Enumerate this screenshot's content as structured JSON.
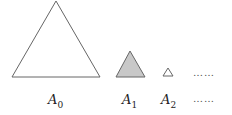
{
  "diagram": {
    "shapes": [
      {
        "id": "A0",
        "label": "A",
        "sub": "0",
        "fill": "#ffffff",
        "stroke": "#666666"
      },
      {
        "id": "A1",
        "label": "A",
        "sub": "1",
        "fill": "#c8c8c8",
        "stroke": "#666666"
      },
      {
        "id": "A2",
        "label": "A",
        "sub": "2",
        "fill": "#ffffff",
        "stroke": "#666666"
      }
    ],
    "continuation_top": "……",
    "continuation_bottom": "……"
  }
}
